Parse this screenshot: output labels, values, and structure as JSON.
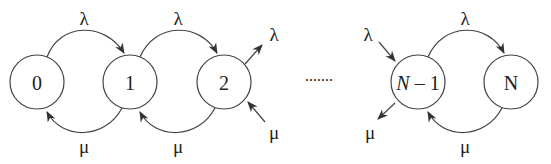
{
  "diagram": {
    "type": "birth-death chain",
    "states": [
      {
        "id": "0",
        "label": "0"
      },
      {
        "id": "1",
        "label": "1"
      },
      {
        "id": "2",
        "label": "2"
      },
      {
        "id": "N-1",
        "label_var": "N",
        "label_rest": " – 1"
      },
      {
        "id": "N",
        "label": "N"
      }
    ],
    "ellipsis": ".......",
    "arrival_rate": "λ",
    "service_rate": "μ",
    "edges": [
      {
        "from": "0",
        "to": "1",
        "label": "λ"
      },
      {
        "from": "1",
        "to": "0",
        "label": "μ"
      },
      {
        "from": "1",
        "to": "2",
        "label": "λ"
      },
      {
        "from": "2",
        "to": "1",
        "label": "μ"
      },
      {
        "from": "2",
        "to": "out",
        "label": "λ"
      },
      {
        "from": "in",
        "to": "2",
        "label": "μ"
      },
      {
        "from": "in",
        "to": "N-1",
        "label": "λ"
      },
      {
        "from": "N-1",
        "to": "out",
        "label": "μ"
      },
      {
        "from": "N-1",
        "to": "N",
        "label": "λ"
      },
      {
        "from": "N",
        "to": "N-1",
        "label": "μ"
      }
    ],
    "colors": {
      "stroke": "#333333",
      "text": "#222222"
    }
  }
}
